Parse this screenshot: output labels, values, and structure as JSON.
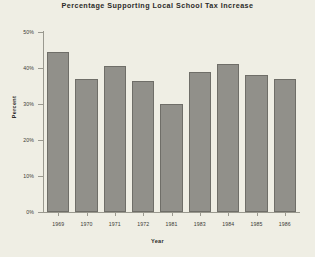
{
  "chart_data": {
    "type": "bar",
    "title": "Percentage Supporting Local School Tax Increase",
    "xlabel": "Year",
    "ylabel": "Percent",
    "categories": [
      "1969",
      "1970",
      "1971",
      "1972",
      "1981",
      "1983",
      "1984",
      "1985",
      "1986"
    ],
    "values": [
      44.5,
      37.0,
      40.5,
      36.5,
      30.0,
      39.0,
      41.0,
      38.0,
      37.0
    ],
    "ylim": [
      0,
      50
    ],
    "yticks": [
      0,
      10,
      20,
      30,
      40,
      50
    ],
    "ytick_labels": [
      "0%",
      "10%",
      "20%",
      "30%",
      "40%",
      "50%"
    ],
    "grid": false,
    "legend": null,
    "bar_color": "#91908a",
    "bar_edge_color": "#6f6e68",
    "background_color": "#efeee4",
    "axis_color": "#9a998f"
  }
}
